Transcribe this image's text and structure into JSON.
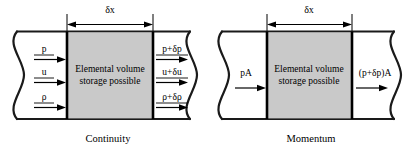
{
  "figure": {
    "background_color": "#ffffff",
    "line_color": "#000000",
    "volume_fill_color": "#c9c9c9"
  },
  "panels": [
    {
      "id": "continuity",
      "caption": "Continuity",
      "dimension_label": "δx",
      "volume_text_line1": "Elemental volume",
      "volume_text_line2": "storage possible",
      "inlet_labels": [
        "p",
        "u",
        "ρ"
      ],
      "outlet_labels": [
        "p+δp",
        "u+δu",
        "ρ+δρ"
      ]
    },
    {
      "id": "momentum",
      "caption": "Momentum",
      "dimension_label": "δx",
      "volume_text_line1": "Elemental volume",
      "volume_text_line2": "storage possible",
      "inlet_labels": [
        "pA"
      ],
      "outlet_labels": [
        "(p+δp)A"
      ]
    }
  ]
}
